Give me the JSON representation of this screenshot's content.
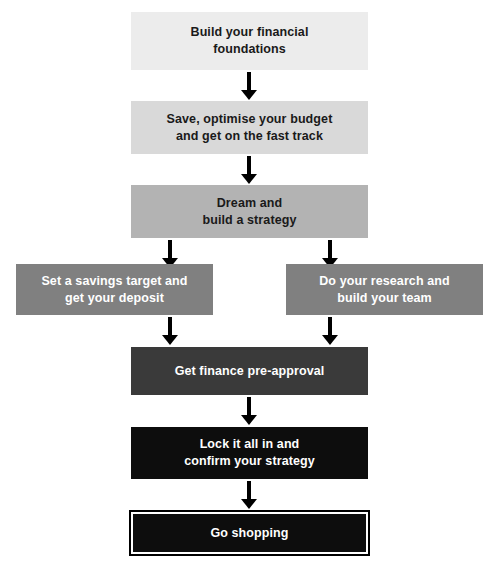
{
  "diagram": {
    "background_color": "#ffffff",
    "arrow_color": "#000000",
    "steps": [
      {
        "id": "build-financial-foundations",
        "label": "Build your financial\nfoundations",
        "tier": 1,
        "fill": "#ececec",
        "text_color": "#1a1a1a"
      },
      {
        "id": "save-optimise-budget",
        "label": "Save, optimise your budget\nand get on the fast track",
        "tier": 2,
        "fill": "#d9d9d9",
        "text_color": "#1a1a1a"
      },
      {
        "id": "dream-build-strategy",
        "label": "Dream and\nbuild a strategy",
        "tier": 3,
        "fill": "#b3b3b3",
        "text_color": "#1a1a1a"
      },
      {
        "id": "savings-target-deposit",
        "label": "Set a savings target and\nget your deposit",
        "tier": 4,
        "fill": "#808080",
        "text_color": "#ffffff"
      },
      {
        "id": "research-build-team",
        "label": "Do your research and\nbuild your team",
        "tier": 4,
        "fill": "#808080",
        "text_color": "#ffffff"
      },
      {
        "id": "finance-pre-approval",
        "label": "Get finance pre-approval",
        "tier": 5,
        "fill": "#3a3a3a",
        "text_color": "#ffffff"
      },
      {
        "id": "lock-it-in",
        "label": "Lock it all in and\nconfirm your strategy",
        "tier": 6,
        "fill": "#0d0d0d",
        "text_color": "#ffffff"
      },
      {
        "id": "go-shopping",
        "label": "Go shopping",
        "tier": 7,
        "fill": "#0d0d0d",
        "text_color": "#ffffff"
      }
    ],
    "connectors": [
      {
        "id": "arrow-1",
        "from": "build-financial-foundations",
        "to": "save-optimise-budget",
        "direction": "down"
      },
      {
        "id": "arrow-2",
        "from": "save-optimise-budget",
        "to": "dream-build-strategy",
        "direction": "down"
      },
      {
        "id": "arrow-3",
        "from": "dream-build-strategy",
        "to": "savings-target-deposit",
        "direction": "down"
      },
      {
        "id": "arrow-4",
        "from": "dream-build-strategy",
        "to": "research-build-team",
        "direction": "down"
      },
      {
        "id": "arrow-5",
        "from": "savings-target-deposit",
        "to": "finance-pre-approval",
        "direction": "down"
      },
      {
        "id": "arrow-6",
        "from": "research-build-team",
        "to": "finance-pre-approval",
        "direction": "down"
      },
      {
        "id": "arrow-7",
        "from": "finance-pre-approval",
        "to": "lock-it-in",
        "direction": "down"
      },
      {
        "id": "arrow-8",
        "from": "lock-it-in",
        "to": "go-shopping",
        "direction": "down"
      }
    ]
  }
}
